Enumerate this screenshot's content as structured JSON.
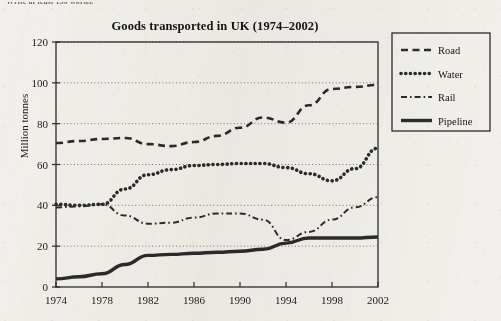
{
  "page": {
    "instruction_text": "Write at least 150 words.",
    "background_color": "#f2f0ec",
    "ink_color": "#2b2b2b"
  },
  "chart_data": {
    "type": "line",
    "title": "Goods transported in UK (1974–2002)",
    "xlabel": "",
    "ylabel": "Million tonnes",
    "xlim": [
      1974,
      2002
    ],
    "ylim": [
      0,
      120
    ],
    "grid": "horizontal-dotted",
    "legend_position": "right-outside",
    "x_ticks": [
      "1974",
      "1978",
      "1982",
      "1986",
      "1990",
      "1994",
      "1998",
      "2002"
    ],
    "y_ticks": [
      "0",
      "20",
      "40",
      "60",
      "80",
      "100",
      "120"
    ],
    "x": [
      1974,
      1976,
      1978,
      1980,
      1982,
      1984,
      1986,
      1988,
      1990,
      1992,
      1994,
      1996,
      1998,
      2000,
      2002
    ],
    "series": [
      {
        "name": "Road",
        "style": "dashed",
        "values": [
          70.5,
          71.5,
          72.5,
          73.0,
          70.0,
          69.0,
          71.0,
          74.0,
          78.0,
          83.0,
          80.5,
          89.0,
          97.0,
          98.0,
          99.0
        ]
      },
      {
        "name": "Water",
        "style": "dotted",
        "values": [
          40.5,
          40.0,
          40.5,
          48.0,
          55.0,
          57.5,
          59.5,
          60.0,
          60.5,
          60.5,
          58.5,
          55.5,
          52.0,
          58.0,
          68.0
        ]
      },
      {
        "name": "Rail",
        "style": "dash-dot",
        "values": [
          39.0,
          39.5,
          40.5,
          35.0,
          31.0,
          31.5,
          34.0,
          36.0,
          36.0,
          33.0,
          23.0,
          27.0,
          33.0,
          39.0,
          44.0
        ]
      },
      {
        "name": "Pipeline",
        "style": "solid",
        "values": [
          4.0,
          5.0,
          6.5,
          11.0,
          15.5,
          16.0,
          16.5,
          17.0,
          17.5,
          18.5,
          21.5,
          24.0,
          24.0,
          24.0,
          24.5
        ]
      }
    ]
  }
}
